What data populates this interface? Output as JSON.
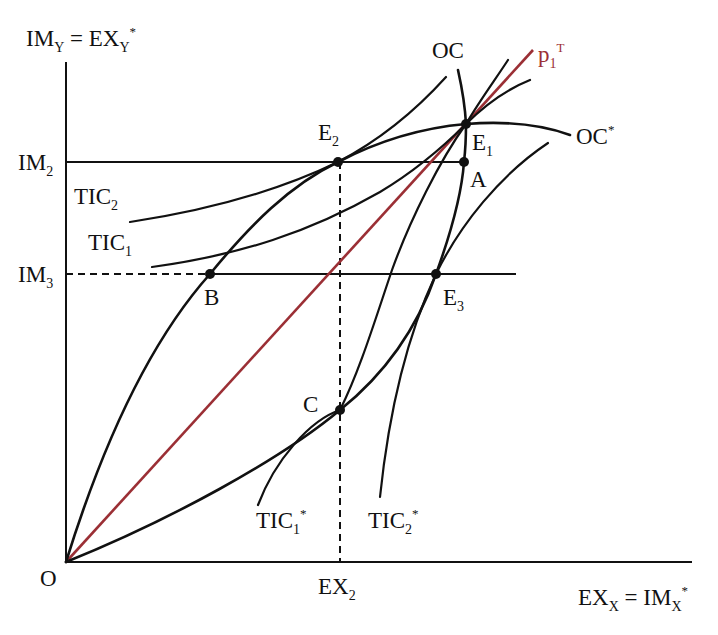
{
  "diagram": {
    "type": "offer-curve-trade-diagram",
    "colors": {
      "ink": "#111111",
      "terms_of_trade_line": "#9b2f35",
      "background": "#ffffff"
    },
    "axes": {
      "y_label": {
        "main": "IM",
        "sub": "Y",
        "eq": " = EX",
        "sub2": "Y",
        "sup": "*"
      },
      "x_label": {
        "main": "EX",
        "sub": "X",
        "eq": " = IM",
        "sub2": "X",
        "sup": "*"
      },
      "origin": "O"
    },
    "ticks": {
      "y": [
        {
          "main": "IM",
          "sub": "2"
        },
        {
          "main": "IM",
          "sub": "3"
        }
      ],
      "x": [
        {
          "main": "EX",
          "sub": "2"
        }
      ]
    },
    "curves": {
      "oc": {
        "label": "OC"
      },
      "oc_star": {
        "label": "OC",
        "sup": "*"
      },
      "tic2": {
        "main": "TIC",
        "sub": "2"
      },
      "tic1": {
        "main": "TIC",
        "sub": "1"
      },
      "tic1_star": {
        "main": "TIC",
        "sub": "1",
        "sup": "*"
      },
      "tic2_star": {
        "main": "TIC",
        "sub": "2",
        "sup": "*"
      },
      "price_line": {
        "main": "p",
        "sub": "1",
        "sup": "T"
      }
    },
    "points": {
      "e1": {
        "main": "E",
        "sub": "1"
      },
      "e2": {
        "main": "E",
        "sub": "2"
      },
      "e3": {
        "main": "E",
        "sub": "3"
      },
      "a": {
        "main": "A"
      },
      "b": {
        "main": "B"
      },
      "c": {
        "main": "C"
      }
    }
  }
}
